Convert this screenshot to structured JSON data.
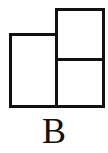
{
  "figure": {
    "label": "B",
    "shapes": [
      {
        "id": "left-rectangle",
        "description": "tall rectangle on the left"
      },
      {
        "id": "top-right-square",
        "description": "square on the top right"
      },
      {
        "id": "bottom-right-square",
        "description": "square on the bottom right"
      }
    ],
    "stroke_color": "#111111",
    "background_color": "#ffffff"
  }
}
